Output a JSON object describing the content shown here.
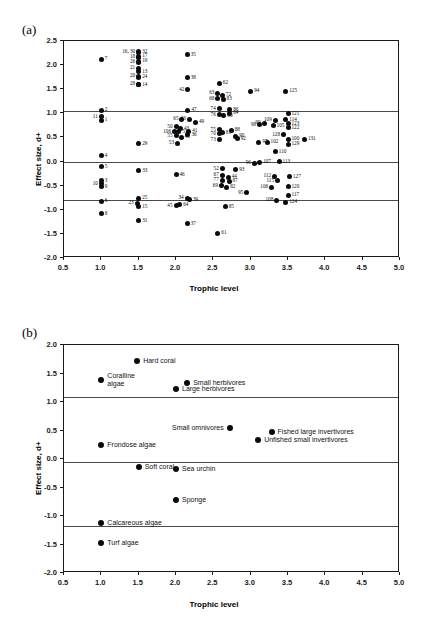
{
  "figure": {
    "panel_a_letter": "(a)",
    "panel_b_letter": "(b)"
  },
  "chart_data": [
    {
      "id": "panel-a",
      "type": "scatter",
      "title": "",
      "panel_label": "(a)",
      "xlabel": "Trophic level",
      "ylabel": "Effect size, d+",
      "xlim": [
        0.5,
        5.0
      ],
      "ylim": [
        -2.0,
        2.5
      ],
      "xticks": [
        "0.5",
        "1.0",
        "1.5",
        "2.0",
        "2.5",
        "3.0",
        "3.5",
        "4.0",
        "4.5",
        "5.0"
      ],
      "yticks": [
        "2.5",
        "2.0",
        "1.5",
        "1.0",
        "0.5",
        "0.0",
        "-0.5",
        "-1.0",
        "-1.5",
        "-2.0"
      ],
      "grid": false,
      "reference_lines": [
        1.05,
        0.0,
        -0.8
      ],
      "legend": "none",
      "points": [
        {
          "label": "7",
          "x": 1.0,
          "y": 2.12,
          "side": "right"
        },
        {
          "label": "2",
          "x": 1.0,
          "y": 1.06,
          "side": "right"
        },
        {
          "label": "1",
          "x": 1.0,
          "y": 0.86,
          "side": "right"
        },
        {
          "label": "11",
          "x": 1.0,
          "y": 0.93,
          "side": "left"
        },
        {
          "label": "4",
          "x": 1.0,
          "y": 0.12,
          "side": "right"
        },
        {
          "label": "5",
          "x": 1.0,
          "y": -0.11,
          "side": "right"
        },
        {
          "label": "3",
          "x": 1.0,
          "y": -0.4,
          "side": "right"
        },
        {
          "label": "9",
          "x": 1.0,
          "y": -0.52,
          "side": "right"
        },
        {
          "label": "10",
          "x": 1.0,
          "y": -0.46,
          "side": "left"
        },
        {
          "label": "6",
          "x": 1.0,
          "y": -0.82,
          "side": "right"
        },
        {
          "label": "8",
          "x": 1.0,
          "y": -1.08,
          "side": "right"
        },
        {
          "label": "16, 30",
          "x": 1.5,
          "y": 2.27,
          "side": "left"
        },
        {
          "label": "32",
          "x": 1.5,
          "y": 2.28,
          "side": "right"
        },
        {
          "label": "18",
          "x": 1.5,
          "y": 2.16,
          "side": "left"
        },
        {
          "label": "26",
          "x": 1.5,
          "y": 2.06,
          "side": "left"
        },
        {
          "label": "17",
          "x": 1.5,
          "y": 2.18,
          "side": "right"
        },
        {
          "label": "19",
          "x": 1.5,
          "y": 2.08,
          "side": "right"
        },
        {
          "label": "21",
          "x": 1.5,
          "y": 1.94,
          "side": "left"
        },
        {
          "label": "13",
          "x": 1.5,
          "y": 1.86,
          "side": "right"
        },
        {
          "label": "20",
          "x": 1.5,
          "y": 1.77,
          "side": "left"
        },
        {
          "label": "24",
          "x": 1.5,
          "y": 1.75,
          "side": "right"
        },
        {
          "label": "28",
          "x": 1.5,
          "y": 1.6,
          "side": "left"
        },
        {
          "label": "14",
          "x": 1.5,
          "y": 1.59,
          "side": "right"
        },
        {
          "label": "29",
          "x": 1.5,
          "y": 0.37,
          "side": "right"
        },
        {
          "label": "33",
          "x": 1.5,
          "y": -0.19,
          "side": "right"
        },
        {
          "label": "25",
          "x": 1.5,
          "y": -0.76,
          "side": "right"
        },
        {
          "label": "23",
          "x": 1.48,
          "y": -0.86,
          "side": "left"
        },
        {
          "label": "15",
          "x": 1.5,
          "y": -0.94,
          "side": "right"
        },
        {
          "label": "31",
          "x": 1.5,
          "y": -1.23,
          "side": "right"
        },
        {
          "label": "35",
          "x": 2.15,
          "y": 2.21,
          "side": "right"
        },
        {
          "label": "38",
          "x": 2.15,
          "y": 1.74,
          "side": "right"
        },
        {
          "label": "42",
          "x": 2.16,
          "y": 1.49,
          "side": "left"
        },
        {
          "label": "47",
          "x": 2.16,
          "y": 1.06,
          "side": "right"
        },
        {
          "label": "50",
          "x": 2.0,
          "y": 0.72,
          "side": "left"
        },
        {
          "label": "65",
          "x": 2.08,
          "y": 0.88,
          "side": "left"
        },
        {
          "label": "66",
          "x": 2.18,
          "y": 0.88,
          "side": "left"
        },
        {
          "label": "49",
          "x": 2.26,
          "y": 0.82,
          "side": "right"
        },
        {
          "label": "43",
          "x": 2.06,
          "y": 0.68,
          "side": "right"
        },
        {
          "label": "41",
          "x": 2.17,
          "y": 0.63,
          "side": "right"
        },
        {
          "label": "106",
          "x": 1.98,
          "y": 0.62,
          "side": "left"
        },
        {
          "label": "51",
          "x": 2.04,
          "y": 0.62,
          "side": "right"
        },
        {
          "label": "36",
          "x": 2.16,
          "y": 0.56,
          "side": "right"
        },
        {
          "label": "55",
          "x": 2.0,
          "y": 0.53,
          "side": "left"
        },
        {
          "label": "48",
          "x": 2.07,
          "y": 0.5,
          "side": "right"
        },
        {
          "label": "53",
          "x": 2.02,
          "y": 0.38,
          "side": "left"
        },
        {
          "label": "46",
          "x": 2.0,
          "y": -0.27,
          "side": "right"
        },
        {
          "label": "34",
          "x": 2.15,
          "y": -0.76,
          "side": "left"
        },
        {
          "label": "39",
          "x": 2.18,
          "y": -0.79,
          "side": "right"
        },
        {
          "label": "45",
          "x": 2.0,
          "y": -0.92,
          "side": "left"
        },
        {
          "label": "64",
          "x": 2.05,
          "y": -0.9,
          "side": "right"
        },
        {
          "label": "37",
          "x": 2.15,
          "y": -1.29,
          "side": "right"
        },
        {
          "label": "62",
          "x": 2.58,
          "y": 1.62,
          "side": "right"
        },
        {
          "label": "63",
          "x": 2.56,
          "y": 1.42,
          "side": "left"
        },
        {
          "label": "72",
          "x": 2.62,
          "y": 1.38,
          "side": "right"
        },
        {
          "label": "68",
          "x": 2.56,
          "y": 1.3,
          "side": "left"
        },
        {
          "label": "83",
          "x": 2.63,
          "y": 1.29,
          "side": "right"
        },
        {
          "label": "74",
          "x": 2.58,
          "y": 1.1,
          "side": "left"
        },
        {
          "label": "86",
          "x": 2.72,
          "y": 1.07,
          "side": "right"
        },
        {
          "label": "76",
          "x": 2.58,
          "y": 0.97,
          "side": "left"
        },
        {
          "label": "80",
          "x": 2.64,
          "y": 0.95,
          "side": "right"
        },
        {
          "label": "64b",
          "x": 2.72,
          "y": 1.0,
          "side": "right"
        },
        {
          "label": "75",
          "x": 2.58,
          "y": 0.66,
          "side": "left"
        },
        {
          "label": "70",
          "x": 2.58,
          "y": 0.58,
          "side": "left"
        },
        {
          "label": "81",
          "x": 2.62,
          "y": 0.6,
          "side": "right"
        },
        {
          "label": "73",
          "x": 2.58,
          "y": 0.45,
          "side": "left"
        },
        {
          "label": "88",
          "x": 2.74,
          "y": 0.65,
          "side": "right"
        },
        {
          "label": "90",
          "x": 2.8,
          "y": 0.52,
          "side": "right"
        },
        {
          "label": "92",
          "x": 2.82,
          "y": 0.47,
          "side": "right"
        },
        {
          "label": "52",
          "x": 2.62,
          "y": -0.15,
          "side": "left"
        },
        {
          "label": "93",
          "x": 2.8,
          "y": -0.17,
          "side": "right"
        },
        {
          "label": "67",
          "x": 2.62,
          "y": -0.28,
          "side": "left"
        },
        {
          "label": "44",
          "x": 2.7,
          "y": -0.33,
          "side": "right"
        },
        {
          "label": "77",
          "x": 2.62,
          "y": -0.39,
          "side": "left"
        },
        {
          "label": "87",
          "x": 2.71,
          "y": -0.41,
          "side": "right"
        },
        {
          "label": "69",
          "x": 2.61,
          "y": -0.5,
          "side": "left"
        },
        {
          "label": "82",
          "x": 2.68,
          "y": -0.53,
          "side": "right"
        },
        {
          "label": "85",
          "x": 2.66,
          "y": -0.94,
          "side": "right"
        },
        {
          "label": "61",
          "x": 2.56,
          "y": -1.49,
          "side": "right"
        },
        {
          "label": "94",
          "x": 3.0,
          "y": 1.46,
          "side": "right"
        },
        {
          "label": "96",
          "x": 3.05,
          "y": -0.03,
          "side": "left"
        },
        {
          "label": "97",
          "x": 3.11,
          "y": 0.4,
          "side": "right"
        },
        {
          "label": "98",
          "x": 3.12,
          "y": 0.76,
          "side": "left"
        },
        {
          "label": "99",
          "x": 3.18,
          "y": 0.79,
          "side": "left"
        },
        {
          "label": "107",
          "x": 3.12,
          "y": -0.01,
          "side": "right"
        },
        {
          "label": "102",
          "x": 3.22,
          "y": 0.4,
          "side": "right"
        },
        {
          "label": "105",
          "x": 3.3,
          "y": 0.74,
          "side": "right"
        },
        {
          "label": "109",
          "x": 3.33,
          "y": 0.86,
          "side": "left"
        },
        {
          "label": "110",
          "x": 3.33,
          "y": 0.2,
          "side": "right"
        },
        {
          "label": "113",
          "x": 3.38,
          "y": 0.0,
          "side": "right"
        },
        {
          "label": "112",
          "x": 3.32,
          "y": -0.3,
          "side": "left"
        },
        {
          "label": "115",
          "x": 3.36,
          "y": -0.4,
          "side": "left"
        },
        {
          "label": "106b",
          "x": 3.28,
          "y": -0.53,
          "side": "left"
        },
        {
          "label": "95",
          "x": 2.95,
          "y": -0.65,
          "side": "left"
        },
        {
          "label": "108",
          "x": 3.35,
          "y": -0.8,
          "side": "left"
        },
        {
          "label": "125",
          "x": 3.47,
          "y": 1.46,
          "side": "right"
        },
        {
          "label": "121",
          "x": 3.5,
          "y": 0.99,
          "side": "right"
        },
        {
          "label": "114",
          "x": 3.47,
          "y": 0.87,
          "side": "right"
        },
        {
          "label": "123",
          "x": 3.5,
          "y": 0.78,
          "side": "right"
        },
        {
          "label": "122",
          "x": 3.5,
          "y": 0.7,
          "side": "right"
        },
        {
          "label": "128",
          "x": 3.44,
          "y": 0.56,
          "side": "left"
        },
        {
          "label": "100",
          "x": 3.5,
          "y": 0.46,
          "side": "right"
        },
        {
          "label": "131",
          "x": 3.72,
          "y": 0.46,
          "side": "right"
        },
        {
          "label": "129",
          "x": 3.5,
          "y": 0.36,
          "side": "right"
        },
        {
          "label": "127",
          "x": 3.52,
          "y": -0.32,
          "side": "right"
        },
        {
          "label": "120",
          "x": 3.5,
          "y": -0.52,
          "side": "right"
        },
        {
          "label": "117",
          "x": 3.5,
          "y": -0.7,
          "side": "right"
        },
        {
          "label": "124",
          "x": 3.47,
          "y": -0.84,
          "side": "right"
        }
      ]
    },
    {
      "id": "panel-b",
      "type": "scatter",
      "title": "",
      "panel_label": "(b)",
      "xlabel": "Trophic level",
      "ylabel": "Effect size, d+",
      "xlim": [
        0.5,
        5.0
      ],
      "ylim": [
        -2.0,
        2.0
      ],
      "xticks": [
        "0.5",
        "1.0",
        "1.5",
        "2.0",
        "2.5",
        "3.0",
        "3.5",
        "4.0",
        "4.5",
        "5.0"
      ],
      "yticks": [
        "2.0",
        "1.5",
        "1.0",
        "0.5",
        "0.0",
        "-0.5",
        "-1.0",
        "-1.5",
        "-2.0"
      ],
      "grid": false,
      "reference_lines": [
        1.08,
        -0.05,
        -1.18
      ],
      "legend": "none",
      "points": [
        {
          "label": "Hard coral",
          "x": 1.48,
          "y": 1.72,
          "side": "right"
        },
        {
          "label": "Coralline algae",
          "x": 1.0,
          "y": 1.38,
          "side": "right",
          "wrap": "Coralline|algae"
        },
        {
          "label": "Small herbivores",
          "x": 2.15,
          "y": 1.33,
          "side": "right"
        },
        {
          "label": "Large herbivores",
          "x": 2.0,
          "y": 1.22,
          "side": "right"
        },
        {
          "label": "Small omnivores",
          "x": 2.72,
          "y": 0.55,
          "side": "left"
        },
        {
          "label": "Fished large invertivores",
          "x": 3.28,
          "y": 0.48,
          "side": "right"
        },
        {
          "label": "Unfished small invertivores",
          "x": 3.1,
          "y": 0.33,
          "side": "right"
        },
        {
          "label": "Frondose algae",
          "x": 1.0,
          "y": 0.25,
          "side": "right"
        },
        {
          "label": "Soft coral",
          "x": 1.5,
          "y": -0.14,
          "side": "right"
        },
        {
          "label": "Sea urchin",
          "x": 2.0,
          "y": -0.18,
          "side": "right"
        },
        {
          "label": "Sponge",
          "x": 2.0,
          "y": -0.72,
          "side": "right"
        },
        {
          "label": "Calcareous algae",
          "x": 1.0,
          "y": -1.13,
          "side": "right"
        },
        {
          "label": "Turf algae",
          "x": 1.0,
          "y": -1.47,
          "side": "right"
        }
      ]
    }
  ]
}
